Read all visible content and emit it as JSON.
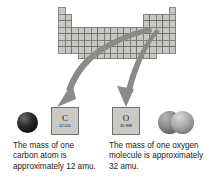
{
  "figure": {
    "background_color": "#ffffff",
    "width": 209,
    "height": 186
  },
  "periodic_table": {
    "name": "periodic-table-outline",
    "cell_fill": "#c7c7c4",
    "cell_stroke": "#6e6e6c",
    "description": "grayscale periodic table grid"
  },
  "arrows": {
    "color": "#8a8a88",
    "left": {
      "name": "arrow-to-carbon"
    },
    "right": {
      "name": "arrow-to-oxygen"
    }
  },
  "carbon": {
    "symbol": "C",
    "atomic_mass": "12.011",
    "model_label": "carbon-atom-sphere",
    "caption": "The mass of one carbon atom is approximately 12 amu."
  },
  "oxygen": {
    "symbol": "O",
    "atomic_mass": "15.999",
    "model_label": "oxygen-molecule-spheres",
    "caption": "The mass of one oxygen molecule is approximately 32 amu."
  },
  "colors": {
    "tile_fill": "#c9c9c6",
    "tile_border": "#6f6f6d",
    "text": "#222222",
    "carbon_sphere": "#1a1a1a",
    "oxygen_sphere": "#8d8d8d"
  }
}
